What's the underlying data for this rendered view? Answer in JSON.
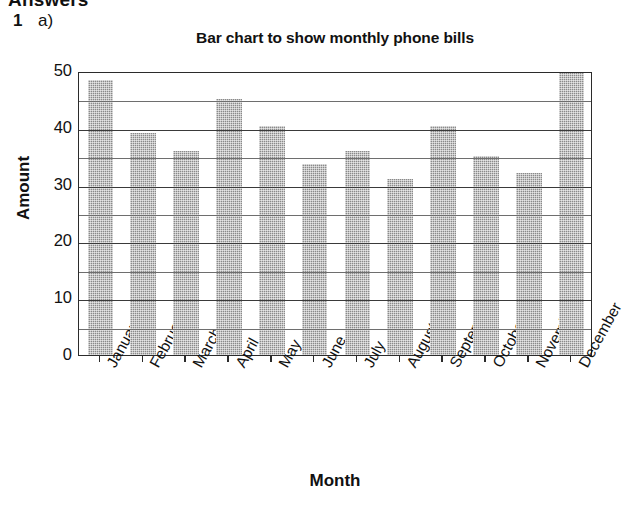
{
  "page": {
    "answers_heading": "Answers",
    "question_number": "1",
    "question_part": "a)"
  },
  "chart_data": {
    "type": "bar",
    "title": "Bar chart to show monthly phone bills",
    "xlabel": "Month",
    "ylabel": "Amount",
    "categories": [
      "January",
      "February",
      "March",
      "April",
      "May",
      "June",
      "July",
      "August",
      "September",
      "October",
      "November",
      "December"
    ],
    "values": [
      48.5,
      39,
      36,
      45,
      40.3,
      33.7,
      36,
      31,
      40.3,
      35,
      32,
      50
    ],
    "ylim": [
      0,
      50
    ],
    "y_major_ticks": [
      0,
      10,
      20,
      30,
      40,
      50
    ],
    "y_minor_ticks": [
      5,
      15,
      25,
      35,
      45
    ],
    "y_tick_labels": [
      "0",
      "10",
      "20",
      "30",
      "40",
      "50"
    ],
    "grid": "horizontal",
    "legend": "none",
    "bar_color": "#8a8a8a",
    "axis_color": "#2b2b2b"
  }
}
